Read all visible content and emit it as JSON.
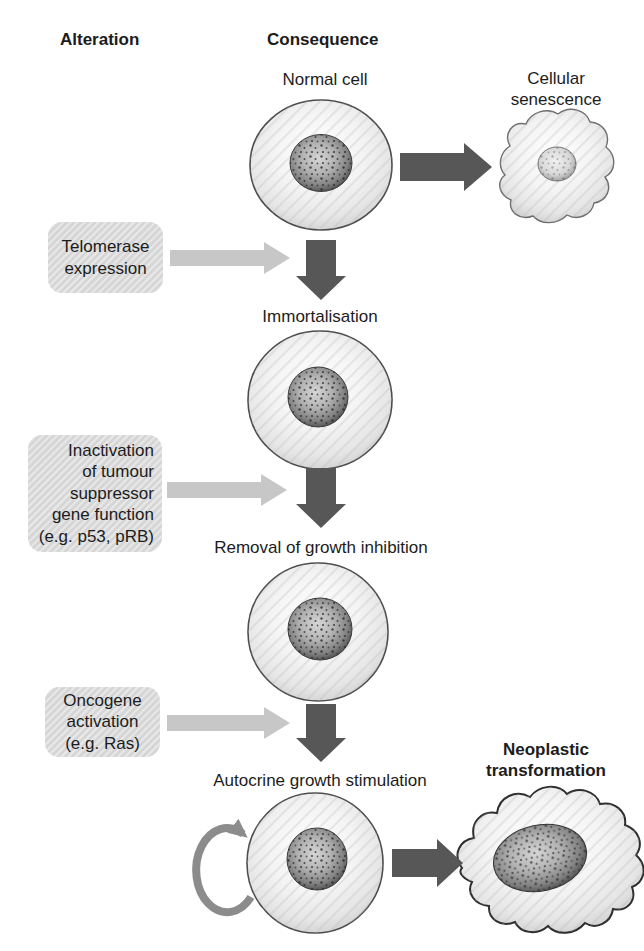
{
  "columns": {
    "alteration_header": "Alteration",
    "consequence_header": "Consequence"
  },
  "flow": {
    "start_label": "Normal cell",
    "steps": [
      {
        "alteration": [
          "Telomerase",
          "expression"
        ],
        "consequence": "Immortalisation"
      },
      {
        "alteration": [
          "Inactivation",
          "of  tumour",
          "suppressor",
          "gene function",
          "(e.g. p53, pRB)"
        ],
        "consequence": "Removal of growth inhibition"
      },
      {
        "alteration": [
          "Oncogene",
          "activation",
          "(e.g. Ras)"
        ],
        "consequence": "Autocrine growth stimulation"
      }
    ],
    "outcomes": {
      "senescence": [
        "Cellular",
        "senescence"
      ],
      "neoplastic": [
        "Neoplastic",
        "transformation"
      ]
    }
  },
  "icons": {
    "down_arrow": "dark-down-arrow",
    "right_arrow_dark": "dark-right-arrow",
    "right_arrow_light": "light-right-arrow",
    "autocrine_loop": "circular-loop-arrow"
  },
  "colors": {
    "dark_arrow": "#575757",
    "light_arrow": "#c7c7c7",
    "loop_arrow": "#8c8c8c",
    "box_fill": "#d9d9d9",
    "cell_outline": "#4d4d4d",
    "background": "#ffffff"
  }
}
